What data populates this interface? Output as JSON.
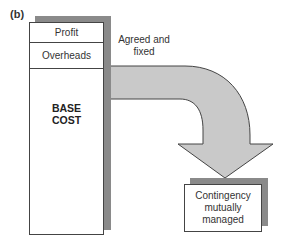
{
  "figure": {
    "panel_label": "(b)",
    "cost_stack": {
      "segments": [
        {
          "label": "Profit"
        },
        {
          "label": "Overheads"
        },
        {
          "label_line1": "BASE",
          "label_line2": "COST"
        }
      ]
    },
    "arrow": {
      "label_line1": "Agreed and",
      "label_line2": "fixed",
      "fill_color": "#c9c9c9",
      "stroke_color": "#444444"
    },
    "target_box": {
      "label_line1": "Contingency",
      "label_line2": "mutually",
      "label_line3": "managed"
    },
    "colors": {
      "shadow": "#8a8a8a",
      "border": "#444444",
      "background": "#ffffff"
    }
  }
}
